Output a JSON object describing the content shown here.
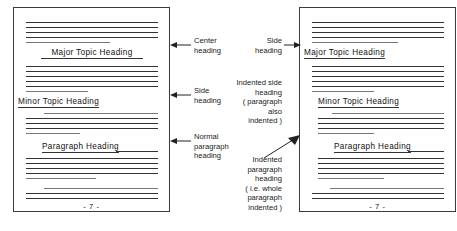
{
  "figure": {
    "title_alt": "Heading placement styles on two sample manuscript pages",
    "ink_color": "#333333",
    "page_border_color": "#3a3a3a"
  },
  "pages": [
    {
      "id": "left",
      "page_number": "- 7 -",
      "headings": [
        {
          "text": "Major Topic Heading",
          "style": "center"
        },
        {
          "text": "Minor Topic Heading",
          "style": "flush-left"
        },
        {
          "text": "Paragraph Heading",
          "style": "indented-run-in"
        }
      ]
    },
    {
      "id": "right",
      "page_number": "- 7 -",
      "headings": [
        {
          "text": "Major Topic Heading",
          "style": "flush-left-side"
        },
        {
          "text": "Minor Topic Heading",
          "style": "indented-side"
        },
        {
          "text": "Paragraph Heading",
          "style": "indented-paragraph-run-in"
        }
      ]
    }
  ],
  "annotations": {
    "left_page": [
      {
        "id": "center-heading",
        "text": "Center\nheading"
      },
      {
        "id": "side-heading",
        "text": "Side\nheading"
      },
      {
        "id": "normal-paragraph-heading",
        "text": "Normal\nparagraph\nheading"
      }
    ],
    "right_page": [
      {
        "id": "side-heading",
        "text": "Side\nheading"
      },
      {
        "id": "indented-side-heading",
        "text": "Indented side\nheading\n( paragraph\nalso\nindented )"
      },
      {
        "id": "indented-paragraph-heading",
        "text": "Indented\nparagraph\nheading\n( i.e. whole\nparagraph\nindented )"
      }
    ]
  }
}
